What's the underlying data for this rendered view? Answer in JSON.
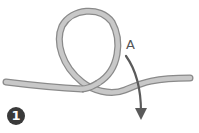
{
  "diagram": {
    "type": "knot-step",
    "step_number": "1",
    "labels": {
      "end_a": "A"
    },
    "colors": {
      "rope_fill": "#c8c8c8",
      "rope_outline": "#8a8a8a",
      "arrow": "#5a5a5a",
      "step_badge": "#3a3a3a"
    }
  }
}
